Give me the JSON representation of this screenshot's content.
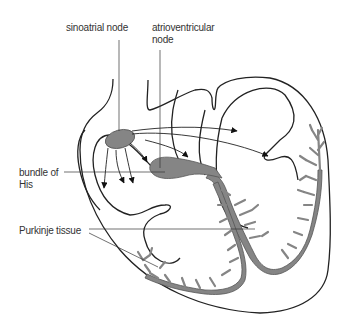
{
  "diagram": {
    "labels": {
      "sa_node": "sinoatrial node",
      "av_node_line1": "atrioventricular",
      "av_node_line2": "node",
      "bundle_line1": "bundle of",
      "bundle_line2": "His",
      "purkinje": "Purkinje tissue"
    },
    "colors": {
      "outline": "#222222",
      "tissue_fill": "#858585",
      "tissue_stroke": "#555555",
      "text": "#333333",
      "background": "#ffffff"
    }
  }
}
